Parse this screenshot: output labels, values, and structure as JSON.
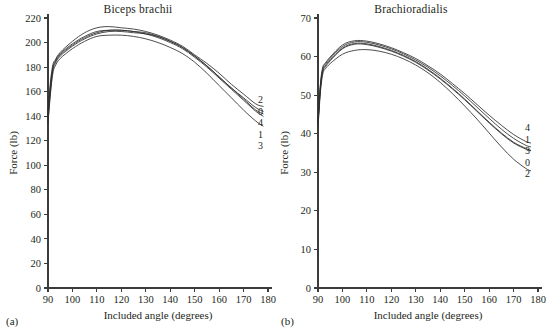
{
  "figure": {
    "background": "#ffffff",
    "ink_color": "#231f20",
    "curve_color": "#2d2d2d"
  },
  "panels": [
    {
      "tag": "(a)",
      "title": "Biceps brachii"
    },
    {
      "tag": "(b)",
      "title": "Brachioradialis"
    }
  ],
  "chart_data": [
    {
      "type": "line",
      "title": "Biceps brachii",
      "panel_tag": "(a)",
      "xlabel": "Included angle (degrees)",
      "ylabel": "Force (lb)",
      "xlim": [
        90,
        180
      ],
      "ylim": [
        0,
        220
      ],
      "xticks": [
        90,
        100,
        110,
        120,
        130,
        140,
        150,
        160,
        170,
        180
      ],
      "yticks": [
        0,
        20,
        40,
        60,
        80,
        100,
        120,
        140,
        160,
        180,
        200,
        220
      ],
      "grid": false,
      "legend_position": "right-end-of-curves",
      "x": [
        90,
        91,
        92,
        93,
        95,
        100,
        105,
        110,
        115,
        120,
        125,
        130,
        135,
        140,
        145,
        150,
        155,
        160,
        165,
        170,
        175,
        178
      ],
      "series": [
        {
          "name": "0",
          "label": "0",
          "values": [
            141,
            165,
            180,
            185,
            191,
            199,
            205,
            209,
            210,
            210,
            209,
            208,
            205,
            201,
            196,
            189,
            181,
            172,
            163,
            155,
            147,
            144
          ]
        },
        {
          "name": "1",
          "label": "1",
          "values": [
            136,
            160,
            177,
            183,
            189,
            197,
            203,
            207,
            209,
            209,
            208,
            207,
            204,
            200,
            195,
            188,
            180,
            171,
            162,
            153,
            144,
            140
          ]
        },
        {
          "name": "2",
          "label": "2",
          "values": [
            143,
            168,
            182,
            186,
            192,
            201,
            208,
            212,
            213,
            212,
            211,
            209,
            206,
            202,
            197,
            190,
            183,
            175,
            166,
            158,
            150,
            148
          ]
        },
        {
          "name": "3",
          "label": "3",
          "values": [
            134,
            158,
            175,
            181,
            187,
            195,
            201,
            205,
            206,
            206,
            205,
            203,
            200,
            196,
            191,
            184,
            175,
            165,
            155,
            145,
            136,
            132
          ]
        },
        {
          "name": "4",
          "label": "4",
          "values": [
            139,
            163,
            179,
            184,
            190,
            198,
            204,
            208,
            210,
            210,
            209,
            207,
            205,
            201,
            196,
            189,
            181,
            172,
            163,
            154,
            145,
            142
          ]
        }
      ],
      "end_labels_top_to_bottom": [
        "2",
        "0",
        "4",
        "1",
        "3"
      ]
    },
    {
      "type": "line",
      "title": "Brachioradialis",
      "panel_tag": "(b)",
      "xlabel": "Included angle (degrees)",
      "ylabel": "Force (lb)",
      "xlim": [
        90,
        180
      ],
      "ylim": [
        0,
        70
      ],
      "xticks": [
        90,
        100,
        110,
        120,
        130,
        140,
        150,
        160,
        170,
        180
      ],
      "yticks": [
        0,
        10,
        20,
        30,
        40,
        50,
        60,
        70
      ],
      "grid": false,
      "legend_position": "right-end-of-curves",
      "x": [
        90,
        91,
        92,
        93,
        95,
        100,
        105,
        110,
        115,
        120,
        125,
        130,
        135,
        140,
        145,
        150,
        155,
        160,
        165,
        170,
        175,
        177
      ],
      "series": [
        {
          "name": "0",
          "label": "0",
          "values": [
            42.5,
            52.0,
            56.5,
            57.6,
            59.2,
            62.2,
            63.4,
            63.3,
            62.6,
            61.6,
            60.3,
            58.7,
            56.7,
            54.4,
            51.8,
            49.0,
            46.0,
            43.0,
            40.2,
            37.8,
            36.2,
            35.7
          ]
        },
        {
          "name": "1",
          "label": "1",
          "values": [
            42.8,
            52.6,
            57.0,
            58.0,
            59.6,
            62.6,
            63.8,
            63.7,
            63.0,
            62.0,
            60.7,
            59.1,
            57.2,
            55.0,
            52.5,
            49.8,
            46.9,
            44.0,
            41.2,
            38.8,
            37.0,
            36.6
          ]
        },
        {
          "name": "2",
          "label": "2",
          "values": [
            41.5,
            50.8,
            55.6,
            56.8,
            58.2,
            60.6,
            61.6,
            61.8,
            61.4,
            60.6,
            59.4,
            57.8,
            55.8,
            53.3,
            50.4,
            47.2,
            43.8,
            40.2,
            36.6,
            33.4,
            31.0,
            30.4
          ]
        },
        {
          "name": "3",
          "label": "3",
          "values": [
            42.2,
            51.6,
            56.2,
            57.3,
            58.9,
            62.0,
            63.2,
            63.1,
            62.4,
            61.4,
            60.1,
            58.5,
            56.5,
            54.2,
            51.6,
            48.8,
            45.8,
            42.8,
            40.0,
            37.6,
            36.0,
            35.6
          ]
        },
        {
          "name": "4",
          "label": "4",
          "values": [
            43.0,
            53.0,
            57.3,
            58.3,
            59.9,
            63.0,
            64.1,
            64.0,
            63.3,
            62.3,
            61.0,
            59.5,
            57.6,
            55.5,
            53.0,
            50.4,
            47.6,
            44.8,
            42.2,
            39.8,
            38.0,
            37.6
          ]
        }
      ],
      "end_labels_top_to_bottom": [
        "4",
        "1",
        "3",
        "0",
        "2"
      ]
    }
  ]
}
